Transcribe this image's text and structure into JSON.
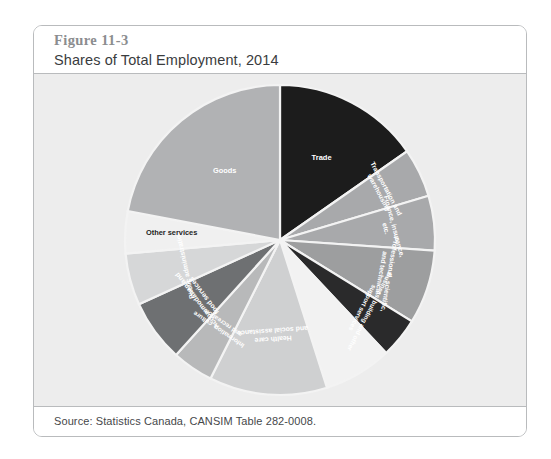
{
  "figure": {
    "number": "Figure 11-3",
    "title": "Shares of Total Employment, 2014",
    "source": "Source: Statistics Canada, CANSIM Table 282-0008."
  },
  "colors": {
    "card_background": "#ffffff",
    "card_border": "#b9bbbd",
    "chart_background": "#ededed",
    "slice_divider": "#f3f3f3",
    "figure_number_text": "#8b8d8f",
    "figure_title_text": "#3a3c3e",
    "source_text": "#46484a"
  },
  "chart_data": {
    "type": "pie",
    "title": "Shares of Total Employment, 2014",
    "subtitle": "",
    "xlabel": "",
    "ylabel": "",
    "legend_position": "none",
    "grid": false,
    "start_angle_deg": 0,
    "direction": "clockwise",
    "labels": [
      "Trade",
      "Transportation and warehousing",
      "Finance, insurance, etc.",
      "Professional, scientific, and technical",
      "Business, building and other support services",
      "Educational services",
      "Health care and social assistance",
      "Information, culture and recreation",
      "Accommodation and food services",
      "Public administration",
      "Other services",
      "Goods"
    ],
    "values": [
      15.3,
      5.1,
      5.7,
      7.7,
      4.2,
      7.1,
      12.3,
      4.3,
      6.5,
      5.4,
      4.4,
      22.0
    ],
    "units": "percent of total employment",
    "slice_colors": [
      "#1c1c1c",
      "#a8a9ab",
      "#a8a9ab",
      "#9d9e9f",
      "#2a2a2b",
      "#f2f2f2",
      "#cfd0d1",
      "#b8b9ba",
      "#6e7072",
      "#d6d7d8",
      "#f0f0f0",
      "#b1b2b4"
    ],
    "label_colors": [
      "#ffffff",
      "#ffffff",
      "#ffffff",
      "#ffffff",
      "#ffffff",
      "#ffffff",
      "#ffffff",
      "#ffffff",
      "#ffffff",
      "#ffffff",
      "#1f1f1f",
      "#ffffff"
    ],
    "label_lines": [
      [
        "Trade"
      ],
      [
        "Transportation and",
        "warehousing"
      ],
      [
        "Finance, insurance,",
        "etc."
      ],
      [
        "Professional, scientific,",
        "and technical"
      ],
      [
        "Business, building and other",
        "support services"
      ],
      [
        ""
      ],
      [
        "Health care",
        "and social assistance"
      ],
      [
        "Information, culture",
        "and recreation"
      ],
      [
        "Accommodation and",
        "food services"
      ],
      [
        "Public administration"
      ],
      [
        "Other services"
      ],
      [
        "Goods"
      ]
    ],
    "label_font_sizes": [
      7.5,
      6.6,
      6.8,
      6.8,
      6.4,
      6.5,
      6.9,
      6.4,
      6.9,
      6.8,
      7.4,
      7.4
    ],
    "label_radius_fraction": [
      0.58,
      0.72,
      0.7,
      0.7,
      0.7,
      0.7,
      0.6,
      0.66,
      0.62,
      0.62,
      0.7,
      0.56
    ],
    "label_rotations_deg": [
      0,
      62,
      75,
      100,
      118,
      0,
      176,
      -146,
      -127,
      -102,
      0,
      0
    ]
  }
}
